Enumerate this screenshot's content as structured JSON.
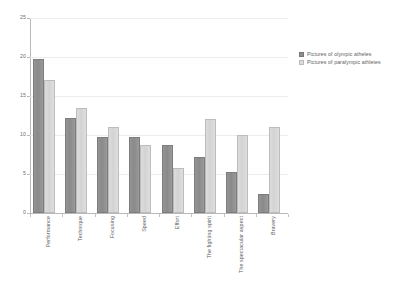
{
  "chart_data": {
    "type": "bar",
    "title": "",
    "subtitle": "",
    "xlabel": "",
    "ylabel": "",
    "ylim": [
      0,
      25
    ],
    "yticks": [
      0,
      5,
      10,
      15,
      20,
      25
    ],
    "grid": true,
    "legend_position": "right",
    "categories": [
      "Performance",
      "Technique",
      "Focusing",
      "Speed",
      "Effort",
      "The fighting spirit",
      "The spectacular aspect",
      "Bravery"
    ],
    "series": [
      {
        "name": "Pictures of olympic atheles",
        "color": "#8e8e8e",
        "values": [
          19.7,
          12.2,
          9.7,
          9.7,
          8.7,
          7.2,
          5.2,
          2.5
        ]
      },
      {
        "name": "Pictures of paralympic athletes",
        "color": "#dcdcdc",
        "values": [
          17.0,
          13.5,
          11.0,
          8.7,
          5.8,
          12.0,
          10.0,
          11.0
        ]
      }
    ]
  },
  "legend": {
    "items": [
      {
        "label": "Pictures of olympic atheles"
      },
      {
        "label": "Pictures of paralympic athletes"
      }
    ]
  },
  "axes": {
    "y": {
      "tick_labels": [
        "0",
        "5",
        "10",
        "15",
        "20",
        "25"
      ]
    }
  }
}
